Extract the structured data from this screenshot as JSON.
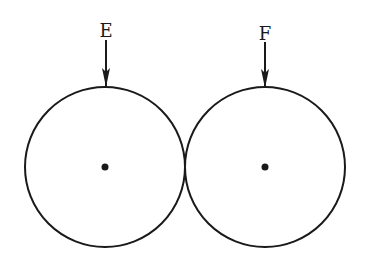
{
  "diagram": {
    "circles": [
      {
        "id": "left",
        "label": "E",
        "cx": 105,
        "cy": 167,
        "r": 80
      },
      {
        "id": "right",
        "label": "F",
        "cx": 265,
        "cy": 167,
        "r": 80
      }
    ],
    "labels": {
      "left": "E",
      "right": "F"
    },
    "colors": {
      "stroke": "#1a1a1a",
      "background": "#ffffff"
    }
  }
}
